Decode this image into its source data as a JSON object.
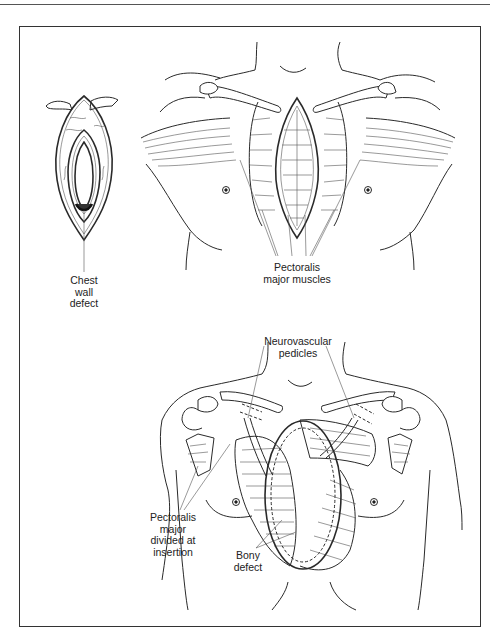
{
  "figure": {
    "type": "medical-illustration",
    "panels": [
      {
        "id": "top",
        "labels": {
          "chest_wall_defect": [
            "Chest",
            "wall",
            "defect"
          ],
          "pectoralis_major_muscles": [
            "Pectoralis",
            "major muscles"
          ]
        }
      },
      {
        "id": "bottom",
        "labels": {
          "neurovascular_pedicles": [
            "Neurovascular",
            "pedicles"
          ],
          "pectoralis_major_divided": [
            "Pectoralis",
            "major",
            "divided at",
            "insertion"
          ],
          "bony_defect": [
            "Bony",
            "defect"
          ]
        }
      }
    ]
  },
  "colors": {
    "line": "#2a2a2a",
    "frame": "#333333",
    "background": "#ffffff"
  }
}
